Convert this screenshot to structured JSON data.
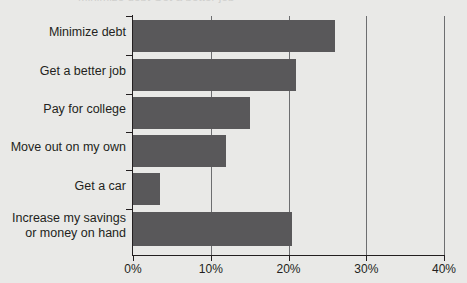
{
  "figure": {
    "title_clipped": "Minimize debt         Get a better job",
    "background_color": "#e9e9e7",
    "bar_color": "#59585a",
    "axis_color": "#231f20",
    "gridline_color": "#6d6e70"
  },
  "chart_data": {
    "type": "bar",
    "orientation": "horizontal",
    "title": "",
    "xlabel": "",
    "ylabel": "",
    "xlim": [
      0,
      40
    ],
    "grid": true,
    "legend": "none",
    "categories": [
      "Minimize debt",
      "Get a better job",
      "Pay for college",
      "Move out on my own",
      "Get a car",
      "Increase my savings\nor money on hand"
    ],
    "values": [
      26,
      21,
      15,
      12,
      3.5,
      20.5
    ],
    "xticks": [
      0,
      10,
      20,
      30,
      40
    ],
    "xticklabels": [
      "0%",
      "10%",
      "20%",
      "30%",
      "40%"
    ]
  }
}
